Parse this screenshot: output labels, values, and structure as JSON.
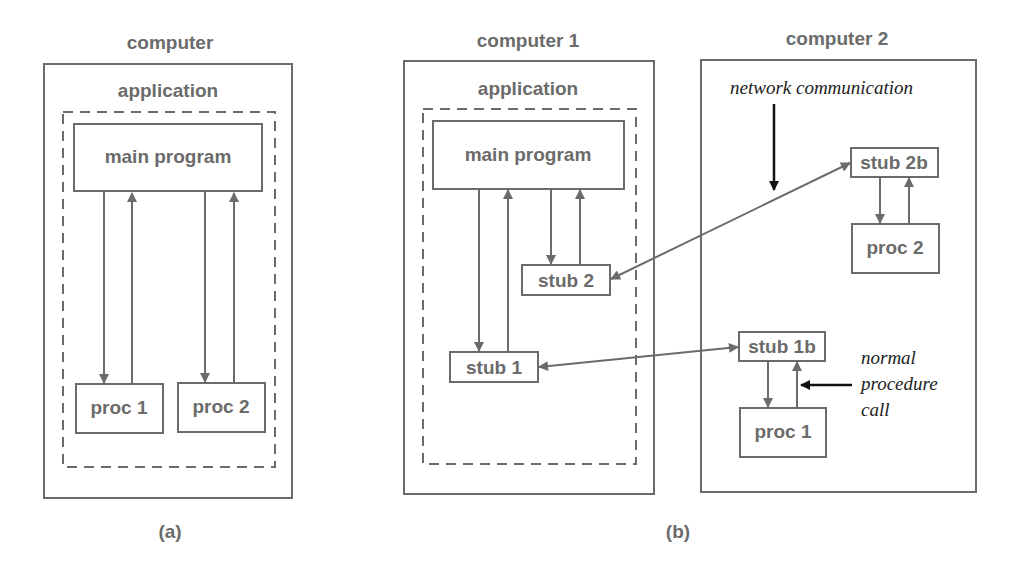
{
  "panel_a": {
    "caption": "(a)",
    "computer_label": "computer",
    "application_label": "application",
    "boxes": {
      "main_program": "main program",
      "proc1": "proc 1",
      "proc2": "proc 2"
    }
  },
  "panel_b": {
    "caption": "(b)",
    "computer1": {
      "label": "computer 1",
      "application_label": "application",
      "boxes": {
        "main_program": "main program",
        "stub1": "stub 1",
        "stub2": "stub 2"
      }
    },
    "computer2": {
      "label": "computer 2",
      "boxes": {
        "stub2b": "stub 2b",
        "proc2": "proc 2",
        "stub1b": "stub 1b",
        "proc1": "proc 1"
      },
      "annotations": {
        "network": "network communication",
        "normal_line1": "normal",
        "normal_line2": "procedure",
        "normal_line3": "call"
      }
    }
  },
  "colors": {
    "stroke": "#6b6b6b",
    "annotation": "#111111",
    "background": "#ffffff"
  }
}
